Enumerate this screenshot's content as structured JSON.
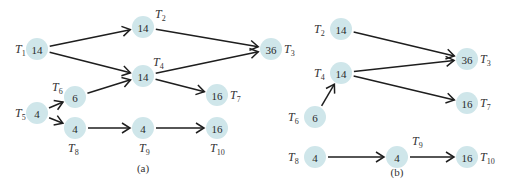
{
  "figure": {
    "panels": [
      {
        "id": "a",
        "caption": "(a)",
        "caption_pos": [
          143,
          172
        ],
        "nodes": [
          {
            "id": "T1",
            "value": "14",
            "x": 37,
            "y": 49,
            "label_main": "T",
            "label_sub": "1",
            "label_pos": [
              15,
              53
            ]
          },
          {
            "id": "T2",
            "value": "14",
            "x": 143,
            "y": 27,
            "label_main": "T",
            "label_sub": "2",
            "label_pos": [
              155,
              18
            ]
          },
          {
            "id": "T3",
            "value": "36",
            "x": 271,
            "y": 49,
            "label_main": "T",
            "label_sub": "3",
            "label_pos": [
              284,
              53
            ]
          },
          {
            "id": "T4",
            "value": "14",
            "x": 143,
            "y": 76,
            "label_main": "T",
            "label_sub": "4",
            "label_pos": [
              153,
              66
            ]
          },
          {
            "id": "T5",
            "value": "4",
            "x": 37,
            "y": 113,
            "label_main": "T",
            "label_sub": "5",
            "label_pos": [
              15,
              117
            ]
          },
          {
            "id": "T6",
            "value": "6",
            "x": 75,
            "y": 97,
            "label_main": "T",
            "label_sub": "6",
            "label_pos": [
              52,
              91
            ]
          },
          {
            "id": "T7",
            "value": "16",
            "x": 217,
            "y": 95,
            "label_main": "T",
            "label_sub": "7",
            "label_pos": [
              230,
              99
            ]
          },
          {
            "id": "T8",
            "value": "4",
            "x": 75,
            "y": 128,
            "label_main": "T",
            "label_sub": "8",
            "label_pos": [
              68,
              152
            ]
          },
          {
            "id": "T9",
            "value": "4",
            "x": 143,
            "y": 128,
            "label_main": "T",
            "label_sub": "9",
            "label_pos": [
              139,
              152
            ]
          },
          {
            "id": "T10",
            "value": "16",
            "x": 217,
            "y": 128,
            "label_main": "T",
            "label_sub": "10",
            "label_pos": [
              210,
              152
            ]
          }
        ],
        "edges": [
          [
            "T1",
            "T2"
          ],
          [
            "T1",
            "T4"
          ],
          [
            "T2",
            "T3"
          ],
          [
            "T4",
            "T3"
          ],
          [
            "T4",
            "T7"
          ],
          [
            "T5",
            "T6"
          ],
          [
            "T5",
            "T8"
          ],
          [
            "T6",
            "T4"
          ],
          [
            "T8",
            "T9"
          ],
          [
            "T9",
            "T10"
          ]
        ]
      },
      {
        "id": "b",
        "caption": "(b)",
        "caption_pos": [
          397,
          176
        ],
        "nodes": [
          {
            "id": "T2",
            "value": "14",
            "x": 341,
            "y": 29,
            "label_main": "T",
            "label_sub": "2",
            "label_pos": [
              314,
              33
            ]
          },
          {
            "id": "T4",
            "value": "14",
            "x": 341,
            "y": 73,
            "label_main": "T",
            "label_sub": "4",
            "label_pos": [
              314,
              77
            ]
          },
          {
            "id": "T6",
            "value": "6",
            "x": 315,
            "y": 117,
            "label_main": "T",
            "label_sub": "6",
            "label_pos": [
              288,
              121
            ]
          },
          {
            "id": "T3",
            "value": "36",
            "x": 467,
            "y": 59,
            "label_main": "T",
            "label_sub": "3",
            "label_pos": [
              480,
              63
            ]
          },
          {
            "id": "T7",
            "value": "16",
            "x": 467,
            "y": 103,
            "label_main": "T",
            "label_sub": "7",
            "label_pos": [
              480,
              107
            ]
          },
          {
            "id": "T8",
            "value": "4",
            "x": 315,
            "y": 157,
            "label_main": "T",
            "label_sub": "8",
            "label_pos": [
              288,
              161
            ]
          },
          {
            "id": "T9",
            "value": "4",
            "x": 397,
            "y": 157,
            "label_main": "T",
            "label_sub": "9",
            "label_pos": [
              412,
              145
            ]
          },
          {
            "id": "T10",
            "value": "16",
            "x": 467,
            "y": 157,
            "label_main": "T",
            "label_sub": "10",
            "label_pos": [
              480,
              161
            ]
          }
        ],
        "edges": [
          [
            "T2",
            "T3"
          ],
          [
            "T4",
            "T3"
          ],
          [
            "T4",
            "T7"
          ],
          [
            "T6",
            "T4"
          ],
          [
            "T8",
            "T9"
          ],
          [
            "T9",
            "T10"
          ]
        ]
      }
    ],
    "style": {
      "node_fill": "#cfe6ea",
      "edge_color": "#1e1e1e",
      "node_radius": 11
    }
  }
}
